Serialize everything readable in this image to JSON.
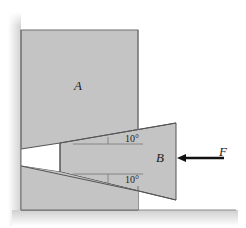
{
  "diagram": {
    "labels": {
      "block_a": "A",
      "wedge_b": "B",
      "force": "F",
      "angle_top": "10°",
      "angle_bottom": "10°"
    },
    "colors": {
      "block_fill": "#c4c4c4",
      "outline": "#6f6f6f",
      "wall_shade": "#d8d8d8",
      "arrow": "#111111",
      "gap": "#ffffff"
    }
  }
}
